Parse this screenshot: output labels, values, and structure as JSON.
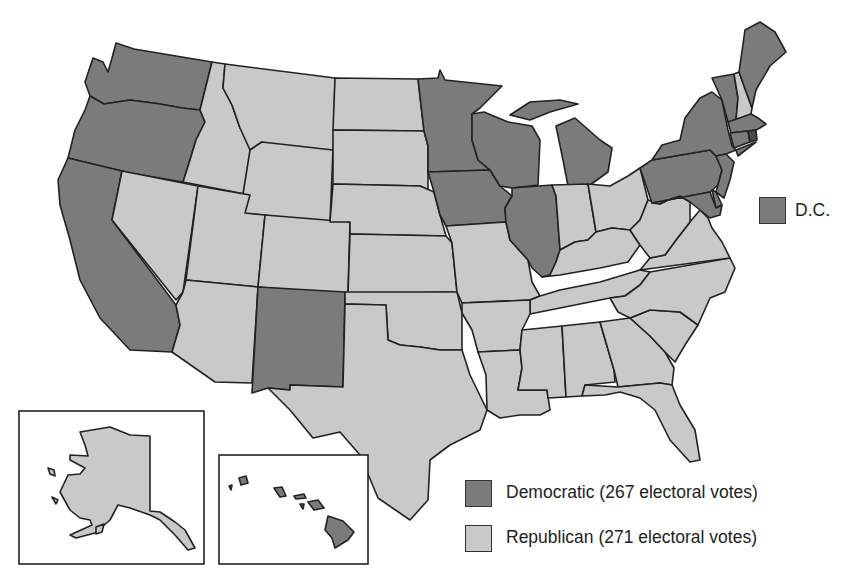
{
  "map": {
    "title": "U.S. Presidential Election Results by State",
    "colors": {
      "democratic": "#7b7b7b",
      "republican": "#c9c9c9",
      "border": "#222222"
    },
    "states": {
      "WA": "D",
      "OR": "D",
      "CA": "D",
      "NM": "D",
      "MN": "D",
      "WI": "D",
      "IA": "D",
      "IL": "D",
      "MI": "D",
      "PA": "D",
      "NY": "D",
      "VT": "D",
      "ME": "D",
      "MA": "D",
      "RI": "D",
      "CT": "D",
      "NJ": "D",
      "DE": "D",
      "MD": "D",
      "HI": "D",
      "DC": "D",
      "ID": "R",
      "MT": "R",
      "WY": "R",
      "NV": "R",
      "UT": "R",
      "CO": "R",
      "AZ": "R",
      "ND": "R",
      "SD": "R",
      "NE": "R",
      "KS": "R",
      "OK": "R",
      "TX": "R",
      "MO": "R",
      "AR": "R",
      "LA": "R",
      "MS": "R",
      "AL": "R",
      "TN": "R",
      "KY": "R",
      "IN": "R",
      "OH": "R",
      "WV": "R",
      "VA": "R",
      "NC": "R",
      "SC": "R",
      "GA": "R",
      "FL": "R",
      "NH": "R",
      "AK": "R"
    },
    "insets": [
      "Alaska",
      "Hawaii"
    ]
  },
  "dc_label": "D.C.",
  "legend": {
    "items": [
      {
        "party": "Democratic",
        "label": "Democratic (267 electoral votes)",
        "electoral_votes": 267,
        "color": "#7b7b7b"
      },
      {
        "party": "Republican",
        "label": "Republican (271 electoral votes)",
        "electoral_votes": 271,
        "color": "#c9c9c9"
      }
    ]
  }
}
